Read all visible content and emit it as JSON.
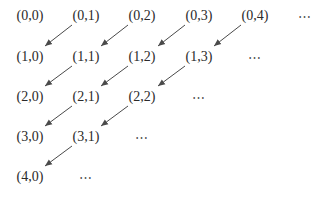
{
  "diagram": {
    "title": "",
    "nodes": [
      {
        "id": "n00",
        "label": "(0,0)",
        "x": 30,
        "y": 16
      },
      {
        "id": "n01",
        "label": "(0,1)",
        "x": 86,
        "y": 16
      },
      {
        "id": "n02",
        "label": "(0,2)",
        "x": 142,
        "y": 16
      },
      {
        "id": "n03",
        "label": "(0,3)",
        "x": 199,
        "y": 16
      },
      {
        "id": "n04",
        "label": "(0,4)",
        "x": 255,
        "y": 16
      },
      {
        "id": "e0",
        "label": "⋯",
        "x": 305,
        "y": 16
      },
      {
        "id": "n10",
        "label": "(1,0)",
        "x": 30,
        "y": 57
      },
      {
        "id": "n11",
        "label": "(1,1)",
        "x": 86,
        "y": 57
      },
      {
        "id": "n12",
        "label": "(1,2)",
        "x": 142,
        "y": 57
      },
      {
        "id": "n13",
        "label": "(1,3)",
        "x": 199,
        "y": 57
      },
      {
        "id": "e1",
        "label": "⋯",
        "x": 255,
        "y": 57
      },
      {
        "id": "n20",
        "label": "(2,0)",
        "x": 30,
        "y": 97
      },
      {
        "id": "n21",
        "label": "(2,1)",
        "x": 86,
        "y": 97
      },
      {
        "id": "n22",
        "label": "(2,2)",
        "x": 142,
        "y": 97
      },
      {
        "id": "e2",
        "label": "⋯",
        "x": 199,
        "y": 97
      },
      {
        "id": "n30",
        "label": "(3,0)",
        "x": 30,
        "y": 137
      },
      {
        "id": "n31",
        "label": "(3,1)",
        "x": 86,
        "y": 137
      },
      {
        "id": "e3",
        "label": "⋯",
        "x": 142,
        "y": 137
      },
      {
        "id": "n40",
        "label": "(4,0)",
        "x": 30,
        "y": 177
      },
      {
        "id": "e4",
        "label": "⋯",
        "x": 86,
        "y": 177
      }
    ],
    "edges": [
      {
        "from": "(0,1)",
        "to": "(1,0)",
        "x1": 72,
        "y1": 25,
        "x2": 45,
        "y2": 46
      },
      {
        "from": "(0,2)",
        "to": "(1,1)",
        "x1": 128,
        "y1": 25,
        "x2": 101,
        "y2": 46
      },
      {
        "from": "(0,3)",
        "to": "(1,2)",
        "x1": 185,
        "y1": 25,
        "x2": 158,
        "y2": 46
      },
      {
        "from": "(0,4)",
        "to": "(1,3)",
        "x1": 241,
        "y1": 25,
        "x2": 214,
        "y2": 46
      },
      {
        "from": "(1,1)",
        "to": "(2,0)",
        "x1": 72,
        "y1": 66,
        "x2": 45,
        "y2": 86
      },
      {
        "from": "(1,2)",
        "to": "(2,1)",
        "x1": 128,
        "y1": 66,
        "x2": 101,
        "y2": 86
      },
      {
        "from": "(1,3)",
        "to": "(2,2)",
        "x1": 185,
        "y1": 66,
        "x2": 158,
        "y2": 86
      },
      {
        "from": "(2,1)",
        "to": "(3,0)",
        "x1": 72,
        "y1": 106,
        "x2": 45,
        "y2": 126
      },
      {
        "from": "(2,2)",
        "to": "(3,1)",
        "x1": 128,
        "y1": 106,
        "x2": 101,
        "y2": 126
      },
      {
        "from": "(3,1)",
        "to": "(4,0)",
        "x1": 72,
        "y1": 146,
        "x2": 45,
        "y2": 166
      }
    ],
    "colors": {
      "text": "#2a2a2a",
      "arrow": "#4a4a4a",
      "background": "#ffffff"
    }
  }
}
